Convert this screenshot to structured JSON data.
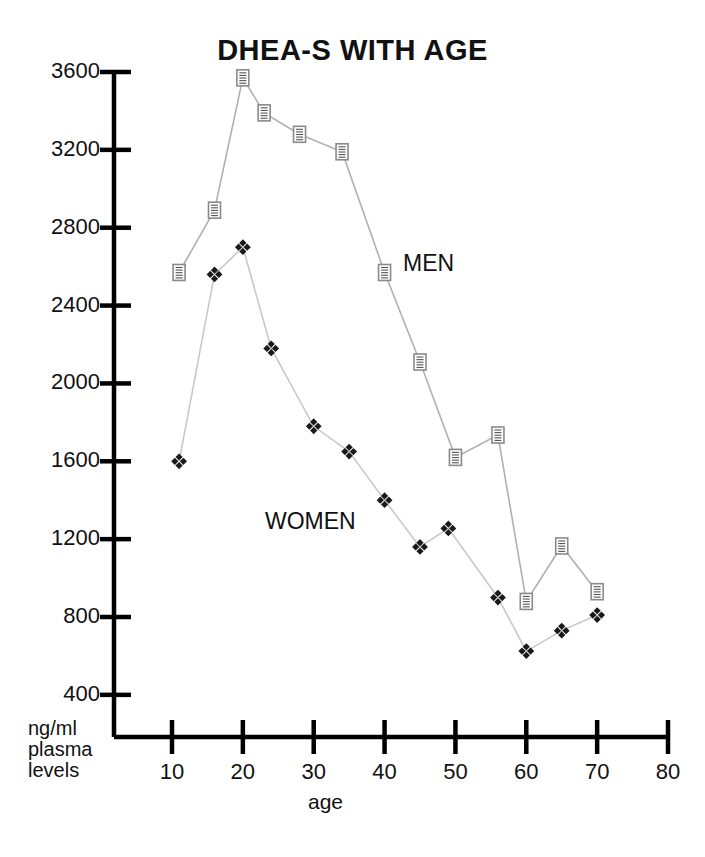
{
  "chart_data": {
    "type": "line",
    "title": "DHEA-S WITH AGE",
    "xlabel": "age",
    "ylabel": "ng/ml plasma levels",
    "ylabel_lines": [
      "ng/ml",
      "plasma",
      "levels"
    ],
    "xlim": [
      0,
      80
    ],
    "ylim": [
      200,
      3700
    ],
    "xticks": [
      10,
      20,
      30,
      40,
      50,
      60,
      70,
      80
    ],
    "yticks": [
      400,
      800,
      1200,
      1600,
      2000,
      2400,
      2800,
      3200,
      3600
    ],
    "grid": false,
    "legend_position": "inline-annotation",
    "series": [
      {
        "name": "MEN",
        "marker": "square-hatched",
        "marker_color": "#8a8a8a",
        "line_color": "#b0b0b0",
        "points": [
          {
            "x": 11,
            "y": 2570
          },
          {
            "x": 16,
            "y": 2890
          },
          {
            "x": 20,
            "y": 3570
          },
          {
            "x": 23,
            "y": 3390
          },
          {
            "x": 28,
            "y": 3280
          },
          {
            "x": 34,
            "y": 3190
          },
          {
            "x": 40,
            "y": 2570
          },
          {
            "x": 45,
            "y": 2110
          },
          {
            "x": 50,
            "y": 1620
          },
          {
            "x": 56,
            "y": 1735
          },
          {
            "x": 60,
            "y": 880
          },
          {
            "x": 65,
            "y": 1165
          },
          {
            "x": 70,
            "y": 930
          }
        ]
      },
      {
        "name": "WOMEN",
        "marker": "diamond-cluster",
        "marker_color": "#1a1a1a",
        "line_color": "#c8c8c8",
        "points": [
          {
            "x": 11,
            "y": 1600
          },
          {
            "x": 16,
            "y": 2560
          },
          {
            "x": 20,
            "y": 2700
          },
          {
            "x": 24,
            "y": 2180
          },
          {
            "x": 30,
            "y": 1780
          },
          {
            "x": 35,
            "y": 1650
          },
          {
            "x": 40,
            "y": 1400
          },
          {
            "x": 45,
            "y": 1160
          },
          {
            "x": 49,
            "y": 1255
          },
          {
            "x": 56,
            "y": 900
          },
          {
            "x": 60,
            "y": 625
          },
          {
            "x": 65,
            "y": 730
          },
          {
            "x": 70,
            "y": 810
          }
        ]
      }
    ],
    "annotations": [
      {
        "text": "MEN",
        "x": 43,
        "y": 2620
      },
      {
        "text": "WOMEN",
        "x": 29,
        "y": 1320
      }
    ]
  }
}
